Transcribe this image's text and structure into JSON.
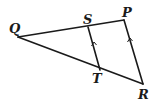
{
  "diagram": {
    "type": "geometry-triangle",
    "points": {
      "Q": {
        "label": "Q",
        "x": 18,
        "y": 37
      },
      "S": {
        "label": "S",
        "x": 88,
        "y": 27
      },
      "P": {
        "label": "P",
        "x": 124,
        "y": 20
      },
      "T": {
        "label": "T",
        "x": 100,
        "y": 70
      },
      "R": {
        "label": "R",
        "x": 143,
        "y": 84
      }
    },
    "segments": [
      "QP",
      "QR",
      "PR",
      "ST"
    ],
    "parallel_marks": [
      "ST",
      "PR"
    ],
    "stroke_color": "#1a1a1a",
    "background": "#ffffff"
  }
}
